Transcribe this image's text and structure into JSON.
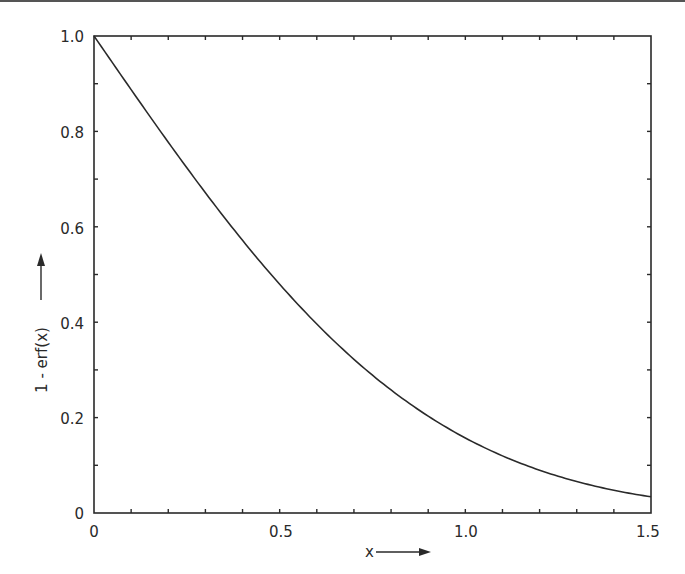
{
  "chart_data": {
    "type": "line",
    "title": "",
    "xlabel": "x",
    "ylabel": "1 - erf(x)",
    "xlim": [
      0,
      1.5
    ],
    "ylim": [
      0,
      1.0
    ],
    "grid": false,
    "legend": null,
    "x_ticks_major": [
      0,
      0.5,
      1.0,
      1.5
    ],
    "x_tick_labels": [
      "0",
      "0.5",
      "1.0",
      "1.5"
    ],
    "x_ticks_minor_step": 0.1,
    "y_ticks_major": [
      0,
      0.2,
      0.4,
      0.6,
      0.8,
      1.0
    ],
    "y_tick_labels": [
      "0",
      "0.2",
      "0.4",
      "0.6",
      "0.8",
      "1.0"
    ],
    "y_ticks_minor_step": 0.1,
    "series": [
      {
        "name": "1 - erf(x)",
        "x": [
          0,
          0.1,
          0.2,
          0.3,
          0.4,
          0.5,
          0.6,
          0.7,
          0.8,
          0.9,
          1.0,
          1.1,
          1.2,
          1.3,
          1.4,
          1.5
        ],
        "values": [
          1.0,
          0.8875,
          0.7773,
          0.6714,
          0.5716,
          0.4795,
          0.3961,
          0.3222,
          0.2579,
          0.2031,
          0.1573,
          0.1198,
          0.0897,
          0.066,
          0.0477,
          0.0339
        ]
      }
    ],
    "colors": {
      "line": "#2a2a2a",
      "axes": "#2a2a2a",
      "background": "#ffffff"
    }
  },
  "labels": {
    "x_axis": "x",
    "y_axis": "1 - erf(x)",
    "x_ticks": [
      "0",
      "0.5",
      "1.0",
      "1.5"
    ],
    "y_ticks": [
      "0",
      "0.2",
      "0.4",
      "0.6",
      "0.8",
      "1.0"
    ]
  }
}
